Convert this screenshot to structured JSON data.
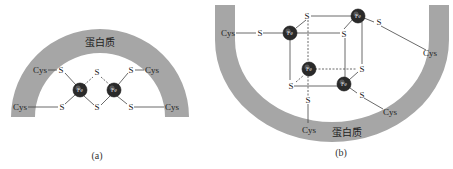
{
  "figure": {
    "colors": {
      "protein_band": "#a6a6a6",
      "bond_line": "#444444",
      "fe_atom": "#2a2a2a",
      "text": "#222222"
    },
    "panel_a": {
      "caption": "(a)",
      "protein_label": "蛋白质",
      "fe_labels": [
        "Fe",
        "Fe"
      ],
      "s_labels": [
        "S",
        "S",
        "S",
        "S",
        "S",
        "S"
      ],
      "cys_labels": [
        "Cys",
        "Cys",
        "Cys",
        "Cys"
      ]
    },
    "panel_b": {
      "caption": "(b)",
      "protein_label": "蛋白质",
      "fe_labels": [
        "Fe",
        "Fe",
        "Fe",
        "Fe"
      ],
      "s_labels": [
        "S",
        "S",
        "S",
        "S",
        "S",
        "S",
        "S",
        "S"
      ],
      "cys_labels": [
        "Cys",
        "Cys",
        "Cys",
        "Cys"
      ]
    }
  }
}
